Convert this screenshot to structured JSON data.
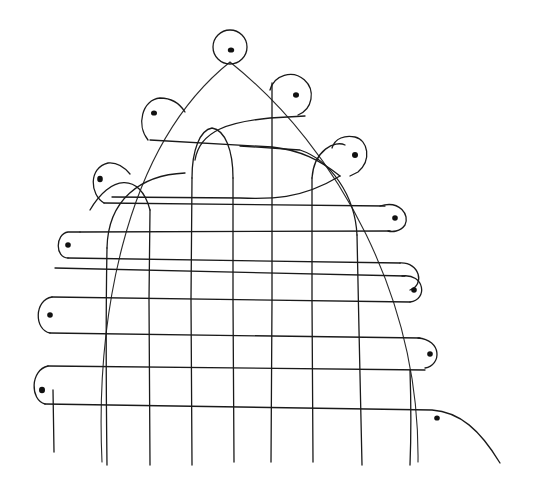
{
  "diagram": {
    "type": "hand-drawn line drawing",
    "colors": {
      "background": "#ffffff",
      "ink": "#1a1a1a"
    },
    "outer_arc": {
      "apex": [
        230,
        62
      ],
      "left_base": [
        102,
        462
      ],
      "right_base": [
        418,
        462
      ]
    },
    "vertical_strands_x": [
      107,
      150,
      192,
      233,
      272,
      312,
      357,
      410
    ],
    "horizontal_strands_y": [
      140,
      175,
      203,
      233,
      268,
      297,
      333,
      362,
      405
    ],
    "loops": [
      {
        "side": "top",
        "cx": 230,
        "cy": 47,
        "r": 17
      },
      {
        "side": "upper-right",
        "cx": 292,
        "cy": 93,
        "r": 20
      },
      {
        "side": "upper-left",
        "cx": 160,
        "cy": 112,
        "r": 17
      },
      {
        "side": "right",
        "cx": 350,
        "cy": 155,
        "r": 18
      },
      {
        "side": "left",
        "cx": 110,
        "cy": 180,
        "r": 17
      },
      {
        "side": "right",
        "cx": 394,
        "cy": 218,
        "r": 13
      },
      {
        "side": "left",
        "cx": 68,
        "cy": 245,
        "r": 13
      },
      {
        "side": "right",
        "cx": 412,
        "cy": 288,
        "r": 13
      },
      {
        "side": "left",
        "cx": 50,
        "cy": 315,
        "r": 15
      },
      {
        "side": "right",
        "cx": 428,
        "cy": 354,
        "r": 13
      },
      {
        "side": "left",
        "cx": 43,
        "cy": 385,
        "r": 15
      }
    ],
    "tail": {
      "dot": [
        437,
        418
      ],
      "end": [
        500,
        463
      ]
    }
  }
}
